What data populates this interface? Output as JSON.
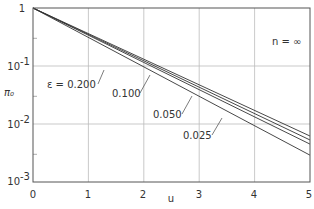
{
  "chart_data": {
    "type": "line",
    "title": "",
    "xlabel": "u",
    "ylabel": "π₀",
    "yscale": "log",
    "xlim": [
      0,
      5
    ],
    "ylim": [
      0.001,
      1
    ],
    "grid": true,
    "annotation": "n = ∞",
    "x_ticks": [
      "0",
      "1",
      "2",
      "3",
      "4",
      "5"
    ],
    "y_ticks": [
      {
        "base": "1",
        "exp": ""
      },
      {
        "base": "10",
        "exp": "-1"
      },
      {
        "base": "10",
        "exp": "-2"
      },
      {
        "base": "10",
        "exp": "-3"
      }
    ],
    "series": [
      {
        "name": "ε = 0.200",
        "label": "ε = 0.200",
        "x": [
          0,
          5
        ],
        "y": [
          1.0,
          0.0062
        ]
      },
      {
        "name": "0.100",
        "label": "0.100",
        "x": [
          0,
          5
        ],
        "y": [
          1.0,
          0.0053
        ]
      },
      {
        "name": "0.050",
        "label": "0.050",
        "x": [
          0,
          5
        ],
        "y": [
          1.0,
          0.0045
        ]
      },
      {
        "name": "0.025",
        "label": "0.025",
        "x": [
          0,
          5
        ],
        "y": [
          1.0,
          0.0029
        ]
      }
    ]
  }
}
